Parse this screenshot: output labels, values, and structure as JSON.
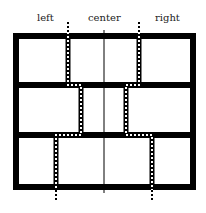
{
  "labels": {
    "left": "left",
    "center": "center",
    "right": "right"
  },
  "colors": {
    "frame": "#000000",
    "background": "#ffffff",
    "dotted_line": "#000000"
  },
  "diagram": {
    "rows": 3,
    "frame": {
      "x": 13,
      "y": 33,
      "width": 183,
      "height": 157,
      "stroke": 6
    },
    "row_dividers_y": [
      85,
      135
    ],
    "center_line_x": 104,
    "dotted_lines": {
      "row1": {
        "left_x": 68,
        "right_x": 139
      },
      "row2": {
        "left_x": 81,
        "right_x": 126
      },
      "row3": {
        "left_x": 56,
        "right_x": 152
      }
    }
  }
}
